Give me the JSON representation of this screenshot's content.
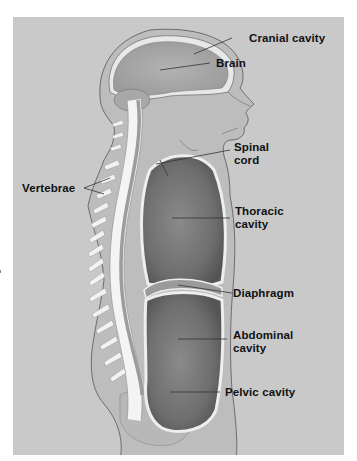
{
  "figure": {
    "background_color": "#c9c9c9",
    "labels": {
      "cranial_cavity": "Cranial cavity",
      "brain": "Brain",
      "spinal_cord_line1": "Spinal",
      "spinal_cord_line2": "cord",
      "vertebrae": "Vertebrae",
      "thoracic_line1": "Thoracic",
      "thoracic_line2": "cavity",
      "diaphragm": "Diaphragm",
      "abdominal_line1": "Abdominal",
      "abdominal_line2": "cavity",
      "pelvic_cavity": "Pelvic cavity"
    }
  }
}
